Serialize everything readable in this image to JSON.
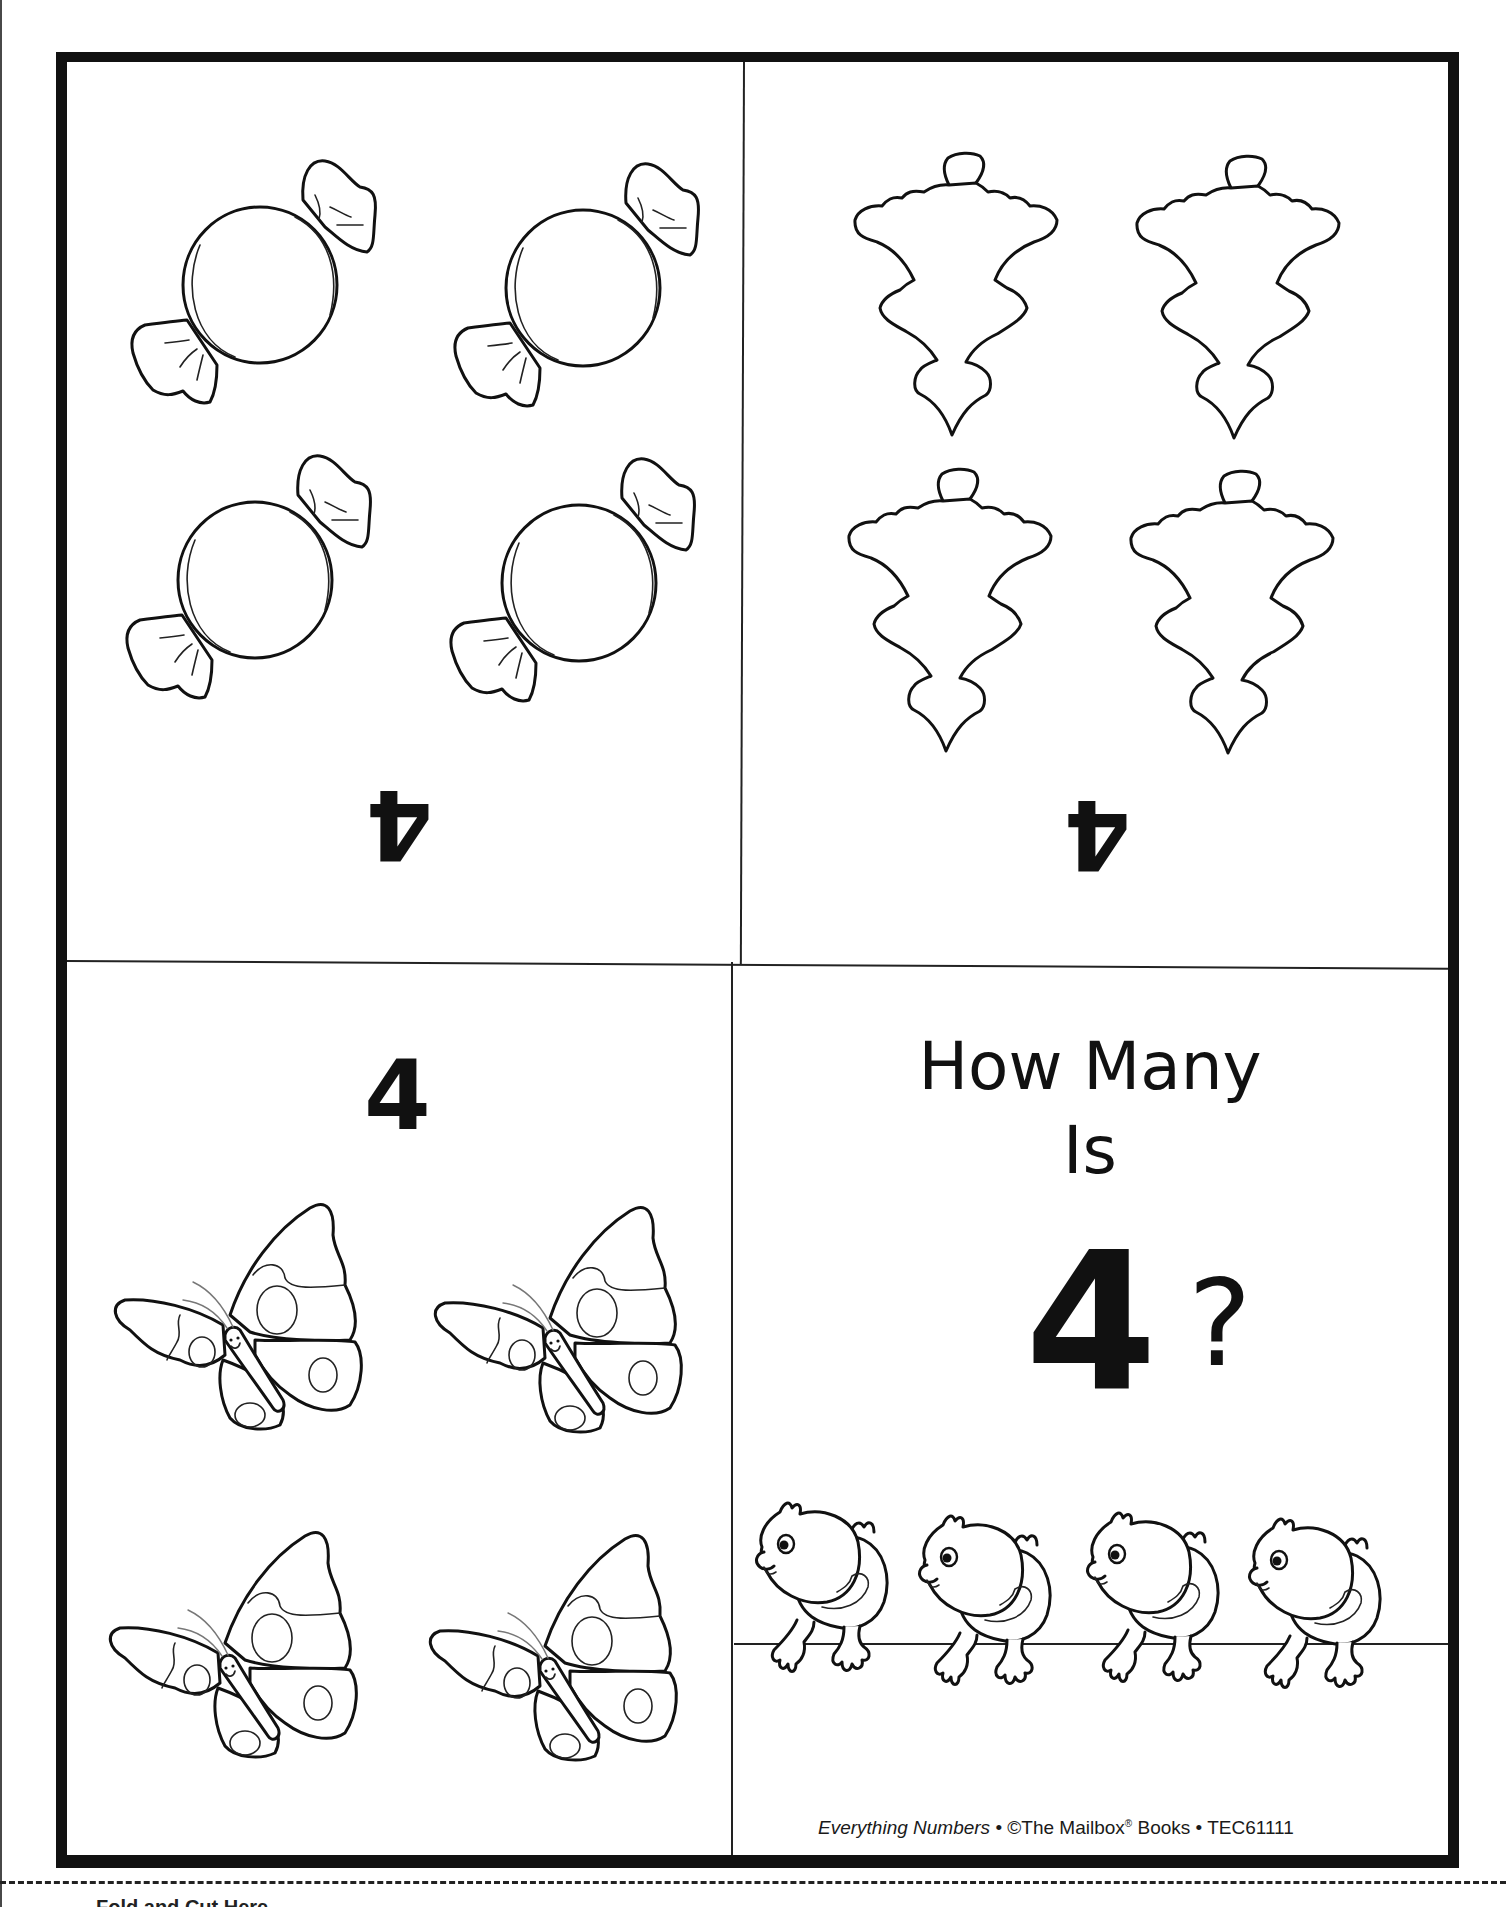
{
  "page": {
    "type": "printable counting booklet page",
    "cut_line": "dashed",
    "cutoff_text": "Fold and Cut Here"
  },
  "panels": {
    "top_left": {
      "numeral": "4",
      "numeral_orientation": "upside-down",
      "illustration": "wrapped-candy",
      "count": 4
    },
    "top_right": {
      "numeral": "4",
      "numeral_orientation": "upside-down",
      "illustration": "ornament",
      "count": 4
    },
    "bottom_left": {
      "numeral": "4",
      "numeral_orientation": "upright",
      "illustration": "butterfly",
      "count": 4
    },
    "bottom_right": {
      "title_line1": "How Many",
      "title_line2": "Is",
      "big_numeral": "4",
      "question_mark": "?",
      "illustration": "chick",
      "count": 4
    }
  },
  "footer": {
    "series_title": "Everything Numbers",
    "separator": " • ",
    "publisher": "©The Mailbox",
    "registered": "®",
    "publisher_suffix": " Books",
    "code": "TEC61111"
  },
  "colors": {
    "ink": "#111111",
    "paper": "#ffffff"
  }
}
